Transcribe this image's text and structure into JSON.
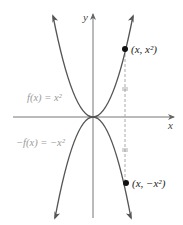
{
  "figure": {
    "axes": {
      "x_label": "x",
      "y_label": "y"
    },
    "curves": [
      {
        "name": "f",
        "label": "f(x) = x²",
        "equation": "y = x^2",
        "direction": "opens-up"
      },
      {
        "name": "neg-f",
        "label": "−f(x) = −x²",
        "equation": "y = -x^2",
        "direction": "opens-down"
      }
    ],
    "points": [
      {
        "name": "upper-point",
        "label": "(x, x²)"
      },
      {
        "name": "lower-point",
        "label": "(x, −x²)"
      }
    ],
    "annotation": "Dashed vertical segment from (x, x²) to (x, −x²) with equal-length tick marks showing reflection across the x-axis",
    "colors": {
      "curve": "#555555",
      "axis": "#777777",
      "label_gray": "#9a9a9a",
      "point": "#111111",
      "dashed": "#aaaaaa"
    }
  }
}
